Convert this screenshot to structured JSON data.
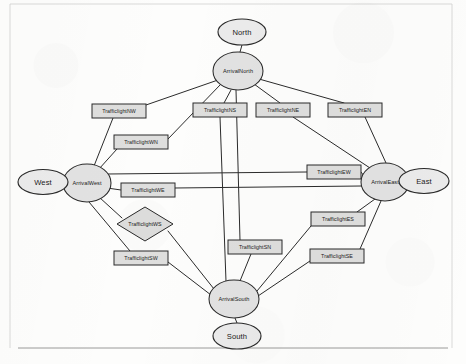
{
  "page": {
    "background_color": "#fdfdfc",
    "ink_color": "#2b2b2b",
    "node_fill": "#e2e2e2",
    "box_fill": "#dededd",
    "rules": [
      {
        "name": "top-rule",
        "x1": 10,
        "y1": 4,
        "x2": 452,
        "y2": 4,
        "style": "faint"
      },
      {
        "name": "left-rule",
        "x1": 10,
        "y1": 4,
        "x2": 10,
        "y2": 348,
        "style": "faint"
      },
      {
        "name": "right-rule",
        "x1": 452,
        "y1": 4,
        "x2": 452,
        "y2": 348,
        "style": "faint"
      },
      {
        "name": "bottom-rule",
        "x1": 18,
        "y1": 348,
        "x2": 448,
        "y2": 348,
        "style": "solid"
      }
    ]
  },
  "graph": {
    "type": "node-link-diagram",
    "direction": "undirected",
    "node_count": 20,
    "terminals": [
      {
        "id": "north",
        "label": "North",
        "shape": "ellipse",
        "cx": 242,
        "cy": 32,
        "rx": 24,
        "ry": 13
      },
      {
        "id": "south",
        "label": "South",
        "shape": "ellipse",
        "cx": 237,
        "cy": 336,
        "rx": 24,
        "ry": 13
      },
      {
        "id": "west",
        "label": "West",
        "shape": "ellipse",
        "cx": 43,
        "cy": 182,
        "rx": 25,
        "ry": 12.5
      },
      {
        "id": "east",
        "label": "East",
        "shape": "ellipse",
        "cx": 424,
        "cy": 181,
        "rx": 25,
        "ry": 12.5
      }
    ],
    "arrivals": [
      {
        "id": "arrivalNorth",
        "label": "ArrivalNorth",
        "shape": "ellipse",
        "cx": 238,
        "cy": 71,
        "rx": 25,
        "ry": 19
      },
      {
        "id": "arrivalSouth",
        "label": "ArrivalSouth",
        "shape": "ellipse",
        "cx": 234,
        "cy": 299,
        "rx": 25,
        "ry": 19
      },
      {
        "id": "arrivalWest",
        "label": "ArrivalWest",
        "shape": "ellipse",
        "cx": 87,
        "cy": 183,
        "rx": 24,
        "ry": 19
      },
      {
        "id": "arrivalEast",
        "label": "ArrivalEast",
        "shape": "ellipse",
        "cx": 385,
        "cy": 182,
        "rx": 24,
        "ry": 19
      }
    ],
    "trafficlights": [
      {
        "id": "tlNW",
        "label": "TrafficlightNW",
        "shape": "rect",
        "cx": 119,
        "cy": 111,
        "w": 54,
        "h": 14
      },
      {
        "id": "tlWN",
        "label": "TrafficlightWN",
        "shape": "rect",
        "cx": 141,
        "cy": 142,
        "w": 54,
        "h": 14
      },
      {
        "id": "tlNS",
        "label": "TrafficlightNS",
        "shape": "rect",
        "cx": 220,
        "cy": 110,
        "w": 54,
        "h": 14
      },
      {
        "id": "tlNE",
        "label": "TrafficlightNE",
        "shape": "rect",
        "cx": 283,
        "cy": 110,
        "w": 54,
        "h": 14
      },
      {
        "id": "tlEN",
        "label": "TrafficlightEN",
        "shape": "rect",
        "cx": 355,
        "cy": 110,
        "w": 54,
        "h": 14
      },
      {
        "id": "tlEW",
        "label": "TrafficlightEW",
        "shape": "rect",
        "cx": 334,
        "cy": 172,
        "w": 54,
        "h": 14
      },
      {
        "id": "tlWE",
        "label": "TrafficlightWE",
        "shape": "rect",
        "cx": 148,
        "cy": 190,
        "w": 54,
        "h": 14
      },
      {
        "id": "tlWS",
        "label": "TrafficlightWS",
        "shape": "diamond",
        "cx": 145,
        "cy": 224,
        "w": 56,
        "h": 34
      },
      {
        "id": "tlSW",
        "label": "TrafficlightSW",
        "shape": "rect",
        "cx": 141,
        "cy": 258,
        "w": 54,
        "h": 14
      },
      {
        "id": "tlSN",
        "label": "TrafficlightSN",
        "shape": "rect",
        "cx": 255,
        "cy": 247,
        "w": 54,
        "h": 14
      },
      {
        "id": "tlES",
        "label": "TrafficlightES",
        "shape": "rect",
        "cx": 338,
        "cy": 219,
        "w": 54,
        "h": 14
      },
      {
        "id": "tlSE",
        "label": "TrafficlightSE",
        "shape": "rect",
        "cx": 337,
        "cy": 256,
        "w": 54,
        "h": 14
      }
    ],
    "edges": [
      {
        "from": "north",
        "to": "arrivalNorth",
        "x1": 242,
        "y1": 45,
        "x2": 240,
        "y2": 52
      },
      {
        "from": "south",
        "to": "arrivalSouth",
        "x1": 237,
        "y1": 323,
        "x2": 235,
        "y2": 318
      },
      {
        "from": "west",
        "to": "arrivalWest",
        "x1": 68,
        "y1": 182,
        "x2": 63,
        "y2": 183
      },
      {
        "from": "east",
        "to": "arrivalEast",
        "x1": 399,
        "y1": 181,
        "x2": 409,
        "y2": 181
      },
      {
        "from": "arrivalNorth",
        "to": "tlNW",
        "x1": 218,
        "y1": 80,
        "x2": 146,
        "y2": 105
      },
      {
        "from": "arrivalNorth",
        "to": "tlWN",
        "x1": 221,
        "y1": 84,
        "x2": 168,
        "y2": 139
      },
      {
        "from": "arrivalNorth",
        "to": "tlNS",
        "x1": 231,
        "y1": 90,
        "x2": 224,
        "y2": 103
      },
      {
        "from": "arrivalNorth",
        "to": "tlNE",
        "x1": 254,
        "y1": 84,
        "x2": 280,
        "y2": 103
      },
      {
        "from": "arrivalNorth",
        "to": "tlEN",
        "x1": 259,
        "y1": 79,
        "x2": 344,
        "y2": 103
      },
      {
        "from": "tlNW",
        "to": "arrivalWest",
        "x1": 113,
        "y1": 118,
        "x2": 94,
        "y2": 166
      },
      {
        "from": "tlWN",
        "to": "arrivalWest",
        "x1": 117,
        "y1": 149,
        "x2": 99,
        "y2": 169
      },
      {
        "from": "tlNS",
        "to": "arrivalSouth",
        "x1": 220,
        "y1": 117,
        "x2": 226,
        "y2": 281
      },
      {
        "from": "tlNE",
        "to": "arrivalEast",
        "x1": 293,
        "y1": 117,
        "x2": 370,
        "y2": 168
      },
      {
        "from": "tlEN",
        "to": "arrivalEast",
        "x1": 365,
        "y1": 117,
        "x2": 386,
        "y2": 163
      },
      {
        "from": "arrivalEast",
        "to": "tlEW",
        "x1": 364,
        "y1": 176,
        "x2": 361,
        "y2": 172
      },
      {
        "from": "tlEW",
        "to": "arrivalWest",
        "x1": 307,
        "y1": 172,
        "x2": 108,
        "y2": 174
      },
      {
        "from": "arrivalWest",
        "to": "tlWE",
        "x1": 107,
        "y1": 188,
        "x2": 121,
        "y2": 190
      },
      {
        "from": "tlWE",
        "to": "arrivalEast",
        "x1": 175,
        "y1": 188,
        "x2": 362,
        "y2": 186
      },
      {
        "from": "arrivalWest",
        "to": "tlWS",
        "x1": 99,
        "y1": 197,
        "x2": 122,
        "y2": 218
      },
      {
        "from": "tlWS",
        "to": "arrivalSouth",
        "x1": 168,
        "y1": 231,
        "x2": 214,
        "y2": 289
      },
      {
        "from": "arrivalWest",
        "to": "tlSW",
        "x1": 89,
        "y1": 202,
        "x2": 130,
        "y2": 251
      },
      {
        "from": "tlSW",
        "to": "arrivalSouth",
        "x1": 168,
        "y1": 262,
        "x2": 211,
        "y2": 295
      },
      {
        "from": "arrivalSouth",
        "to": "tlSN",
        "x1": 240,
        "y1": 281,
        "x2": 251,
        "y2": 254
      },
      {
        "from": "tlSN",
        "to": "arrivalNorth",
        "x1": 240,
        "y1": 240,
        "x2": 236,
        "y2": 90
      },
      {
        "from": "arrivalEast",
        "to": "tlES",
        "x1": 375,
        "y1": 199,
        "x2": 357,
        "y2": 212
      },
      {
        "from": "tlES",
        "to": "arrivalSouth",
        "x1": 311,
        "y1": 226,
        "x2": 257,
        "y2": 291
      },
      {
        "from": "arrivalEast",
        "to": "tlSE",
        "x1": 381,
        "y1": 201,
        "x2": 360,
        "y2": 249
      },
      {
        "from": "tlSE",
        "to": "arrivalSouth",
        "x1": 310,
        "y1": 261,
        "x2": 258,
        "y2": 296
      }
    ]
  }
}
